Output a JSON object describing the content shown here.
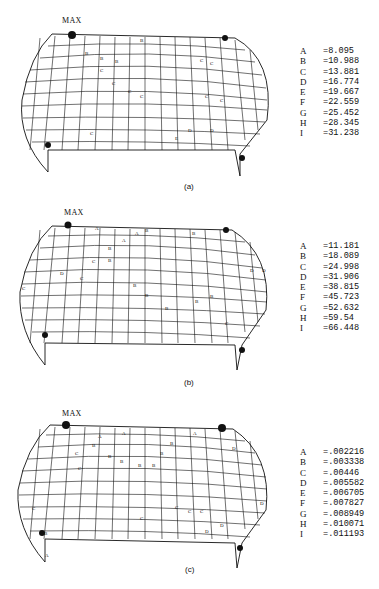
{
  "figure": {
    "panels": [
      {
        "caption": "(a)",
        "max_label": "MAX",
        "legend": [
          {
            "key": "A",
            "value": "=8.095"
          },
          {
            "key": "B",
            "value": "=10.988"
          },
          {
            "key": "C",
            "value": "=13.881"
          },
          {
            "key": "D",
            "value": "=16.774"
          },
          {
            "key": "E",
            "value": "=19.667"
          },
          {
            "key": "F",
            "value": "=22.559"
          },
          {
            "key": "G",
            "value": "=25.452"
          },
          {
            "key": "H",
            "value": "=28.345"
          },
          {
            "key": "I",
            "value": "=31.238"
          }
        ]
      },
      {
        "caption": "(b)",
        "max_label": "MAX",
        "legend": [
          {
            "key": "A",
            "value": "=11.181"
          },
          {
            "key": "B",
            "value": "=18.089"
          },
          {
            "key": "C",
            "value": "=24.998"
          },
          {
            "key": "D",
            "value": "=31.906"
          },
          {
            "key": "E",
            "value": "=38.815"
          },
          {
            "key": "F",
            "value": "=45.723"
          },
          {
            "key": "G",
            "value": "=52.632"
          },
          {
            "key": "H",
            "value": "=59.54"
          },
          {
            "key": "I",
            "value": "=66.448"
          }
        ]
      },
      {
        "caption": "(c)",
        "max_label": "MAX",
        "legend": [
          {
            "key": "A",
            "value": "=.002216"
          },
          {
            "key": "B",
            "value": "=.003338"
          },
          {
            "key": "C",
            "value": "=.00446"
          },
          {
            "key": "D",
            "value": "=.005582"
          },
          {
            "key": "E",
            "value": "=.006705"
          },
          {
            "key": "F",
            "value": "=.007827"
          },
          {
            "key": "G",
            "value": "=.008949"
          },
          {
            "key": "H",
            "value": "=.010071"
          },
          {
            "key": "I",
            "value": "=.011193"
          }
        ]
      }
    ]
  }
}
